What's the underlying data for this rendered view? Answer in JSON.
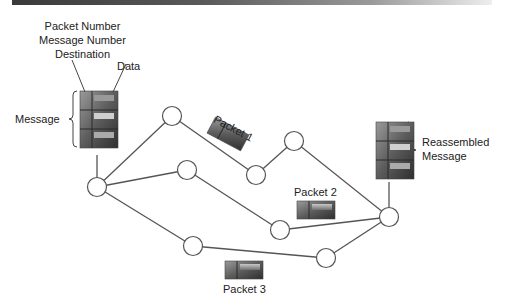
{
  "diagram": {
    "title_labels": {
      "header_line1": "Packet Number",
      "header_line2": "Message Number",
      "header_line3": "Destination",
      "data": "Data",
      "message": "Message",
      "reassembled_line1": "Reassembled",
      "reassembled_line2": "Message"
    },
    "packets": [
      {
        "id": "packet-1",
        "label": "Packet 1"
      },
      {
        "id": "packet-2",
        "label": "Packet 2"
      },
      {
        "id": "packet-3",
        "label": "Packet 3"
      }
    ],
    "colors": {
      "line": "#555555",
      "node_fill": "#ffffff",
      "block_dark": "#3d3d3d",
      "block_mid": "#7a7a7a",
      "block_light": "#b8b8b8"
    }
  }
}
